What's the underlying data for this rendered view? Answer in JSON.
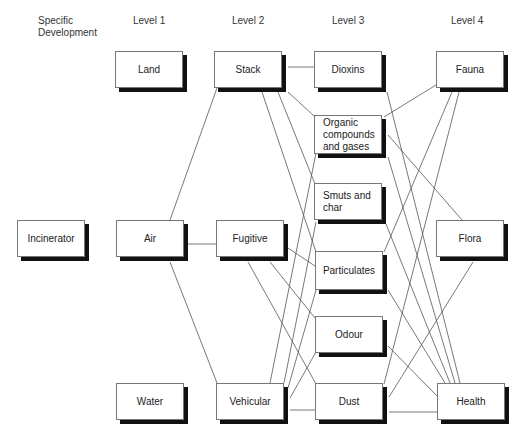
{
  "headers": {
    "specific": "Specific\nDevelopment",
    "level1": "Level 1",
    "level2": "Level 2",
    "level3": "Level 3",
    "level4": "Level 4"
  },
  "nodes": {
    "incinerator": "Incinerator",
    "land": "Land",
    "air": "Air",
    "water": "Water",
    "stack": "Stack",
    "fugitive": "Fugitive",
    "vehicular": "Vehicular",
    "dioxins": "Dioxins",
    "organic": "Organic\ncompounds\nand gases",
    "smuts": "Smuts and\nchar",
    "particulates": "Particulates",
    "odour": "Odour",
    "dust": "Dust",
    "fauna": "Fauna",
    "flora": "Flora",
    "health": "Health"
  },
  "edges": [
    [
      "air",
      "stack"
    ],
    [
      "air",
      "fugitive"
    ],
    [
      "air",
      "vehicular"
    ],
    [
      "stack",
      "dioxins"
    ],
    [
      "stack",
      "organic"
    ],
    [
      "stack",
      "smuts"
    ],
    [
      "stack",
      "particulates"
    ],
    [
      "fugitive",
      "particulates"
    ],
    [
      "fugitive",
      "odour"
    ],
    [
      "fugitive",
      "dust"
    ],
    [
      "vehicular",
      "organic"
    ],
    [
      "vehicular",
      "smuts"
    ],
    [
      "vehicular",
      "particulates"
    ],
    [
      "vehicular",
      "odour"
    ],
    [
      "vehicular",
      "dust"
    ],
    [
      "dioxins",
      "health"
    ],
    [
      "organic",
      "fauna"
    ],
    [
      "organic",
      "flora"
    ],
    [
      "organic",
      "health"
    ],
    [
      "smuts",
      "health"
    ],
    [
      "particulates",
      "fauna"
    ],
    [
      "particulates",
      "health"
    ],
    [
      "odour",
      "health"
    ],
    [
      "dust",
      "fauna"
    ],
    [
      "dust",
      "flora"
    ],
    [
      "dust",
      "health"
    ]
  ]
}
